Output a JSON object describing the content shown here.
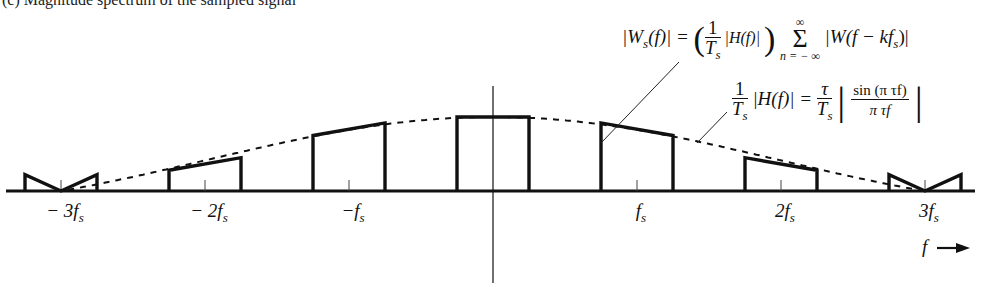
{
  "caption": "(c) Magnitude spectrum of the sampled signal",
  "equations": {
    "ws": {
      "lhs": "|W",
      "lhs_sub": "s",
      "lhs_arg": "(f)| = ",
      "frac_num": "1",
      "frac_den": "T",
      "frac_den_sub": "s",
      "h_term": " |H(f)| ",
      "sum_top": "∞",
      "sum_sigma": "Σ",
      "sum_bottom": "n = − ∞",
      "rhs": "|W(f − kf",
      "rhs_sub": "s",
      "rhs_end": ")|"
    },
    "h": {
      "frac_num": "1",
      "frac_den": "T",
      "frac_den_sub": "s",
      "lhs": "|H(f)| = ",
      "tau_num": "τ",
      "tau_den": "T",
      "tau_den_sub": "s",
      "sinc_num": "sin (π τf)",
      "sinc_den": "π τf"
    }
  },
  "axis": {
    "variable": "f",
    "ticks": [
      {
        "label": "− 3f",
        "sub": "s",
        "k": -3
      },
      {
        "label": "− 2f",
        "sub": "s",
        "k": -2
      },
      {
        "label": "−f",
        "sub": "s",
        "k": -1
      },
      {
        "label": "f",
        "sub": "s",
        "k": 1
      },
      {
        "label": "2f",
        "sub": "s",
        "k": 2
      },
      {
        "label": "3f",
        "sub": "s",
        "k": 3
      }
    ]
  },
  "chart_data": {
    "type": "line",
    "title": "",
    "xlabel": "f",
    "ylabel": "|W_s(f)|",
    "x_units": "multiples of f_s",
    "xlim": [
      -3.4,
      3.4
    ],
    "pulse_halfwidth_fs": 0.25,
    "envelope": "(τ/T_s)|sin(πτf)/(πτf)|",
    "envelope_zero_at_fs": 3,
    "spectral_copies": [
      {
        "center": -3,
        "heights": [
          0.22,
          0.0,
          0.22
        ]
      },
      {
        "center": -2,
        "heights": [
          0.28,
          0.45
        ]
      },
      {
        "center": -1,
        "heights": [
          0.75,
          0.92
        ]
      },
      {
        "center": 0,
        "heights": [
          1.0,
          1.0
        ]
      },
      {
        "center": 1,
        "heights": [
          0.92,
          0.75
        ]
      },
      {
        "center": 2,
        "heights": [
          0.45,
          0.28
        ]
      },
      {
        "center": 3,
        "heights": [
          0.22,
          0.0,
          0.22
        ]
      }
    ],
    "annotations": [
      "|W_s(f)| pointer to copy at f_s",
      "(1/T_s)|H(f)| pointer to dashed envelope"
    ]
  }
}
